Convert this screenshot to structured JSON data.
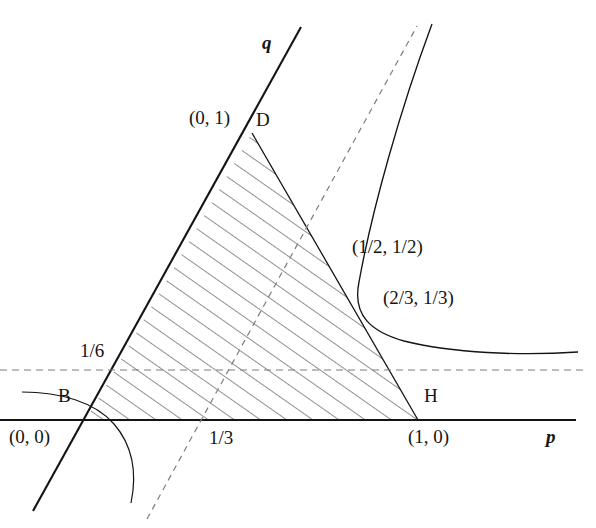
{
  "figure": {
    "type": "math-diagram",
    "axes": {
      "x_axis_label": "p",
      "y_axis_label": "q",
      "origin_label": "(0, 0)"
    },
    "points": [
      {
        "id": "B",
        "label": "B",
        "coord_label": "(0, 0)",
        "p": 0,
        "q": 0
      },
      {
        "id": "D",
        "label": "D",
        "coord_label": "(0, 1)",
        "p": 0.5,
        "q": 1
      },
      {
        "id": "H",
        "label": "H",
        "coord_label": "(1, 0)",
        "p": 1,
        "q": 0
      },
      {
        "id": "C1",
        "label": "",
        "coord_label": "(1/2, 1/2)",
        "p": 0.5,
        "q": 0.5
      },
      {
        "id": "C2",
        "label": "",
        "coord_label": "(2/3, 1/3)",
        "p": 0.6667,
        "q": 0.3333
      }
    ],
    "tick_labels": [
      {
        "axis": "q",
        "text": "1/6",
        "value": 0.1667
      },
      {
        "axis": "p",
        "text": "1/3",
        "value": 0.3333
      }
    ],
    "lines": {
      "solid_ray_q": "q-axis ray through origin with positive slope",
      "dashed_horizontal": "q = 1/6",
      "dashed_diagonal": "line through p = 1/3",
      "curve": "hyperbola branch through (1/2, 1/2) and (2/3, 1/3) asymptotic to q = 1/6",
      "arc": "small circular arc near the origin"
    },
    "shading": {
      "style": "diagonal-hatching",
      "region": "triangle B-D-H"
    },
    "colors": {
      "ink": "#141414",
      "hatch": "#5a5a5a",
      "dash": "#7a7a7a",
      "background": "#ffffff"
    }
  }
}
